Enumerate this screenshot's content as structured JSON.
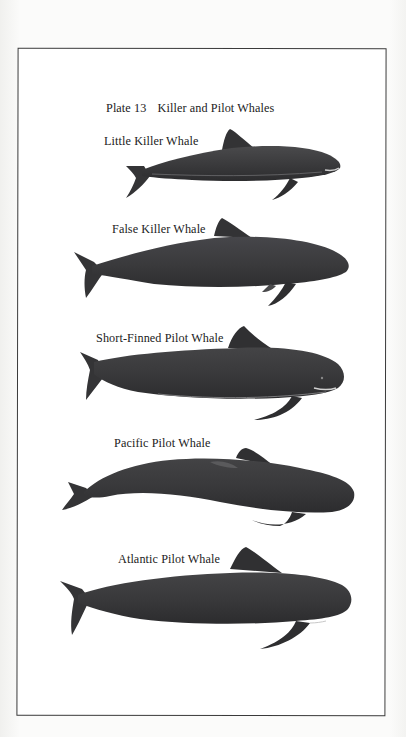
{
  "plate": {
    "number": "Plate 13",
    "title": "Killer and Pilot Whales"
  },
  "species": [
    {
      "name": "Little Killer Whale",
      "icon": "little-killer-whale-illustration"
    },
    {
      "name": "False Killer Whale",
      "icon": "false-killer-whale-illustration"
    },
    {
      "name": "Short-Finned Pilot Whale",
      "icon": "short-finned-pilot-whale-illustration"
    },
    {
      "name": "Pacific Pilot Whale",
      "icon": "pacific-pilot-whale-illustration"
    },
    {
      "name": "Atlantic Pilot Whale",
      "icon": "atlantic-pilot-whale-illustration"
    }
  ],
  "colors": {
    "whale_body": "#3c3c3e",
    "whale_shade": "#2a2a2c",
    "whale_belly_highlight": "#8a8a8a",
    "frame_border": "#3a3a3a",
    "text": "#222222",
    "page_background": "#fafaf8"
  }
}
